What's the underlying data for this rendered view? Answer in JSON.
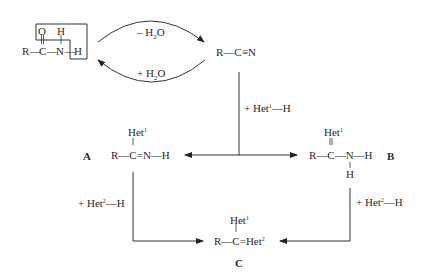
{
  "amide": {
    "R": "R",
    "C": "C",
    "N": "N",
    "O": "O",
    "H_top": "H",
    "H_right": "H",
    "bond_RC": "—",
    "bond_CN": "—",
    "bond_NH": "—"
  },
  "dehydration": {
    "label_minus": "– H",
    "sub": "2",
    "tail": "O"
  },
  "hydration": {
    "label_plus": "+ H",
    "sub": "2",
    "tail": "O"
  },
  "nitrile": {
    "R": "R",
    "bond": "—",
    "C": "C",
    "triple": "≡",
    "N": "N"
  },
  "reagent1": {
    "prefix": "+ Het",
    "sup": "1",
    "suffix": "—H"
  },
  "compoundA": {
    "label": "A",
    "het": "Het",
    "het_sup": "1",
    "formula": "R—C=N—H"
  },
  "compoundB": {
    "label": "B",
    "het": "Het",
    "het_sup": "1",
    "formula": "R—C—N—H",
    "bottom_H": "H"
  },
  "reagent2_left": {
    "prefix": "+ Het",
    "sup": "2",
    "suffix": "—H"
  },
  "reagent2_right": {
    "prefix": "+ Het",
    "sup": "2",
    "suffix": "—H"
  },
  "compoundC": {
    "label": "C",
    "het": "Het",
    "het_sup": "1",
    "formula_main": "R—C=Het",
    "formula_sup": "2"
  }
}
